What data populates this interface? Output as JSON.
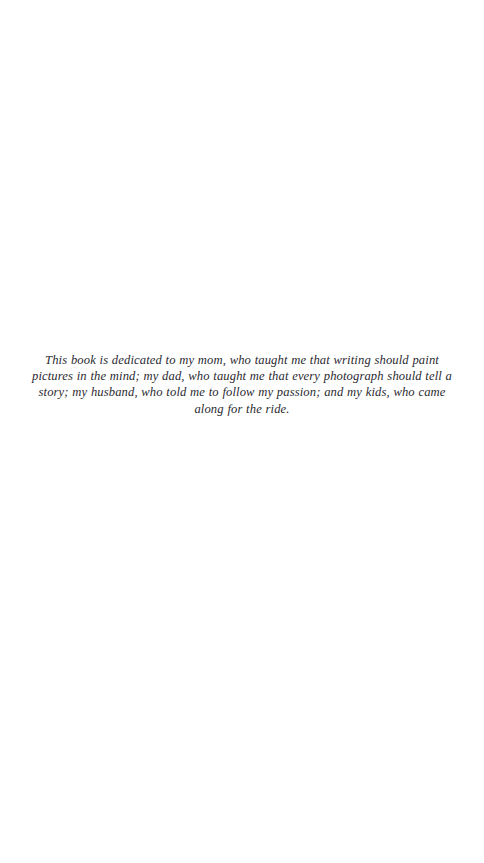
{
  "page": {
    "kind": "book-dedication-page",
    "background_color": "#ffffff",
    "text_color": "#2a2a30"
  },
  "dedication": {
    "text": "This book is dedicated to my mom, who taught me that writing should paint pictures in the mind; my dad, who taught me that every photograph should tell a story; my husband, who told me to follow my passion; and my kids, who came along for the ride.",
    "lines": [
      "This book is dedicated to my mom, who taught me that writing should paint",
      "pictures in the mind; my dad, who taught me that every photograph should tell a",
      "story; my husband, who told me to follow my passion; and my kids, who came",
      "along for the ride."
    ]
  }
}
